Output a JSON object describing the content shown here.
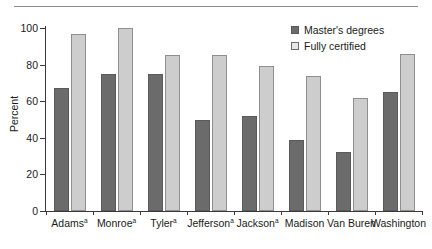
{
  "chart_data": {
    "type": "bar",
    "title": "",
    "xlabel": "",
    "ylabel": "Percent",
    "ylim": [
      0,
      100
    ],
    "yticks": [
      0,
      20,
      40,
      60,
      80,
      100
    ],
    "grid": false,
    "legend_position": "top-right",
    "categories": [
      "Adams",
      "Monroe",
      "Tyler",
      "Jefferson",
      "Jackson",
      "Madison",
      "Van Buren",
      "Washington"
    ],
    "category_footnote_marks": [
      "a",
      "a",
      "a",
      "a",
      "a",
      "",
      "",
      ""
    ],
    "series": [
      {
        "name": "Master's degrees",
        "color": "#6b6b6b",
        "values": [
          67,
          75,
          75,
          50,
          52,
          39,
          32,
          65
        ]
      },
      {
        "name": "Fully certified",
        "color": "#cdcdcd",
        "values": [
          97,
          100,
          85,
          85,
          79,
          74,
          62,
          86
        ]
      }
    ]
  },
  "legend": {
    "items": [
      {
        "label": "Master's degrees",
        "swatch": "masters"
      },
      {
        "label": "Fully certified",
        "swatch": "certified"
      }
    ]
  },
  "axis": {
    "y_label": "Percent",
    "y_tick_labels": [
      "0",
      "20",
      "40",
      "60",
      "80",
      "100"
    ]
  }
}
